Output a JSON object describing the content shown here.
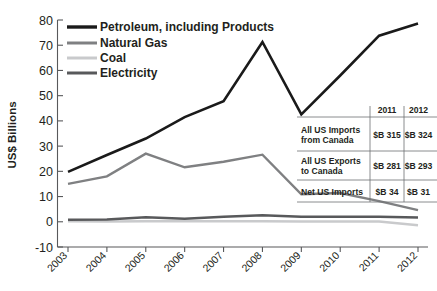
{
  "chart_data": {
    "type": "line",
    "title": "",
    "xlabel": "",
    "ylabel": "US$ Billions",
    "ylim": [
      -10,
      80
    ],
    "yticks": [
      -10,
      0,
      10,
      20,
      30,
      40,
      50,
      60,
      70,
      80
    ],
    "ytick_labels": [
      "-10",
      "0",
      "10",
      "20",
      "30",
      "40",
      "50",
      "60",
      "70",
      "80"
    ],
    "categories": [
      "2003",
      "2004",
      "2005",
      "2006",
      "2007",
      "2008",
      "2009",
      "2010",
      "2011",
      "2012"
    ],
    "grid": false,
    "legend_position": "top-left",
    "series": [
      {
        "name": "Petroleum, including Products",
        "color": "#1a1a1a",
        "values": [
          19.8,
          26.5,
          33.0,
          41.5,
          47.8,
          71.3,
          42.6,
          58.0,
          73.8,
          78.6
        ]
      },
      {
        "name": "Natural Gas",
        "color": "#7f8082",
        "values": [
          15.0,
          18.0,
          27.0,
          21.6,
          23.8,
          26.6,
          10.9,
          11.4,
          8.2,
          4.6
        ]
      },
      {
        "name": "Coal",
        "color": "#c9cacc",
        "values": [
          0.2,
          0.1,
          0.2,
          0.2,
          0.2,
          0.2,
          0.1,
          0.1,
          0.1,
          -1.4
        ]
      },
      {
        "name": "Electricity",
        "color": "#58595b",
        "values": [
          0.8,
          0.9,
          1.8,
          1.2,
          2.0,
          2.6,
          2.0,
          2.0,
          2.0,
          1.7
        ]
      }
    ]
  },
  "legend": {
    "items": [
      {
        "label": "Petroleum, including Products",
        "color": "#1a1a1a"
      },
      {
        "label": "Natural Gas",
        "color": "#7f8082"
      },
      {
        "label": "Coal",
        "color": "#c9cacc"
      },
      {
        "label": "Electricity",
        "color": "#58595b"
      }
    ]
  },
  "inset_table": {
    "columns": [
      "",
      "2011",
      "2012"
    ],
    "rows": [
      {
        "label_line1": "All US Imports",
        "label_line2": "from Canada",
        "v2011": "$B 315",
        "v2012": "$B 324"
      },
      {
        "label_line1": "All US Exports",
        "label_line2": "to Canada",
        "v2011": "$B 281",
        "v2012": "$B 293"
      },
      {
        "label_line1": "Net US Imports",
        "label_line2": "",
        "v2011": "$B 34",
        "v2012": "$B 31"
      }
    ]
  }
}
